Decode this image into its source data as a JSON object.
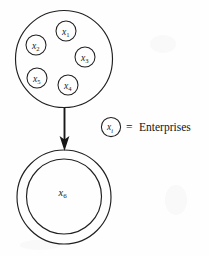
{
  "figure": {
    "caption_present": false,
    "background_color": "#fefefe",
    "ink_color": "#202020"
  },
  "top_group": {
    "name": "industry-group-circle",
    "members": [
      {
        "id": "x1",
        "label": "x",
        "subscript": "1",
        "cx": 66,
        "cy": 31,
        "r": 10
      },
      {
        "id": "x2",
        "label": "x",
        "subscript": "2",
        "cx": 36,
        "cy": 45,
        "r": 10
      },
      {
        "id": "x3",
        "label": "x",
        "subscript": "3",
        "cx": 85,
        "cy": 57,
        "r": 10
      },
      {
        "id": "x4",
        "label": "x",
        "subscript": "4",
        "cx": 68,
        "cy": 85,
        "r": 10
      },
      {
        "id": "x5",
        "label": "x",
        "subscript": "5",
        "cx": 37,
        "cy": 78,
        "r": 10
      }
    ]
  },
  "arrow": {
    "name": "downward-arrow",
    "from_y": 110,
    "to_y": 150,
    "x": 64
  },
  "bottom_group": {
    "name": "merged-entity-double-circle",
    "label": "x",
    "subscript": "6",
    "label_x": 63,
    "label_y": 196
  },
  "legend": {
    "symbol_label": "x",
    "symbol_subscript": "i",
    "equals": "=",
    "meaning": "Enterprises"
  }
}
